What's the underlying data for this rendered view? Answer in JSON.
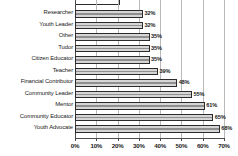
{
  "chart_data": {
    "type": "bar",
    "orientation": "horizontal",
    "title": "",
    "subtitle": "",
    "xlabel": "",
    "ylabel": "",
    "xlim": [
      0,
      70
    ],
    "xtick_labels": [
      "0%",
      "10%",
      "20%",
      "30%",
      "40%",
      "50%",
      "60%",
      "70%"
    ],
    "xtick_values": [
      0,
      10,
      20,
      30,
      40,
      50,
      60,
      70
    ],
    "grid": true,
    "legend": false,
    "categories": [
      "Researcher",
      "Youth Leader",
      "Other",
      "Tudor",
      "Citizen Educator",
      "Teacher",
      "Financial Contributor",
      "Community Leader",
      "Mentor",
      "Community Educator",
      "Youth Advocate"
    ],
    "values": [
      32,
      32,
      35,
      35,
      35,
      39,
      48,
      55,
      61,
      65,
      68
    ],
    "value_labels": [
      "32%",
      "32%",
      "35%",
      "35%",
      "35%",
      "39%",
      "48%",
      "55%",
      "61%",
      "65%",
      "68%"
    ],
    "colors": {
      "bar_fill": "#d6d6d6",
      "bar_stroke": "#2b2b2b",
      "gridline": "#b9b9b9",
      "axis": "#4a4a4a",
      "text": "#1a1a1a",
      "background": "#ffffff"
    }
  }
}
